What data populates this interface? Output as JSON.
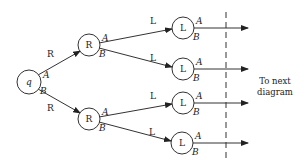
{
  "diagram": {
    "type": "state-transition tree",
    "root": {
      "label": "q",
      "cx": 29,
      "cy": 82,
      "r": 12
    },
    "level1": [
      {
        "label": "R",
        "cx": 89,
        "cy": 45,
        "r": 11,
        "edge_label": "R",
        "from_port": "A"
      },
      {
        "label": "R",
        "cx": 89,
        "cy": 119,
        "r": 11,
        "edge_label": "R",
        "from_port": "B"
      }
    ],
    "level2": [
      {
        "label": "L",
        "cx": 183,
        "cy": 28,
        "r": 11,
        "edge_label": "L",
        "parent": 0,
        "from_port": "A"
      },
      {
        "label": "L",
        "cx": 183,
        "cy": 69,
        "r": 11,
        "edge_label": "L",
        "parent": 0,
        "from_port": "B"
      },
      {
        "label": "L",
        "cx": 183,
        "cy": 103,
        "r": 11,
        "edge_label": "L",
        "parent": 1,
        "from_port": "A"
      },
      {
        "label": "L",
        "cx": 182,
        "cy": 143,
        "r": 11,
        "edge_label": "L",
        "parent": 1,
        "from_port": "B"
      }
    ],
    "port_labels": {
      "top": "A",
      "bottom": "B"
    },
    "divider": {
      "x": 226,
      "y1": 12,
      "y2": 160,
      "style": "dashed"
    },
    "output_arrow_end_x": 248,
    "caption": {
      "line1": "To next",
      "line2": "diagram"
    }
  }
}
